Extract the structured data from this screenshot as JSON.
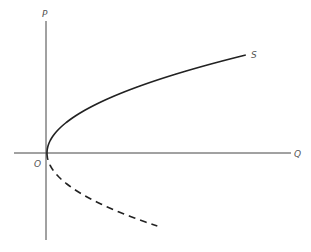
{
  "diagram": {
    "axes": {
      "y_label": "P",
      "x_label": "Q",
      "origin_label": "O"
    },
    "curves": [
      {
        "name": "supply-curve",
        "label": "S",
        "style": "solid"
      },
      {
        "name": "negative-branch",
        "label": "",
        "style": "dashed"
      }
    ],
    "colors": {
      "background": "#ffffff",
      "axis": "#444444",
      "curve": "#222222",
      "label": "#555555"
    }
  },
  "chart_data": {
    "type": "line",
    "title": "",
    "xlabel": "Q",
    "ylabel": "P",
    "grid": false,
    "series": [
      {
        "name": "S",
        "style": "solid",
        "shape": "upper branch of sideways parabola Q = aP^2, P >= 0"
      },
      {
        "name": "",
        "style": "dashed",
        "shape": "lower branch of sideways parabola Q = aP^2, P < 0"
      }
    ]
  }
}
